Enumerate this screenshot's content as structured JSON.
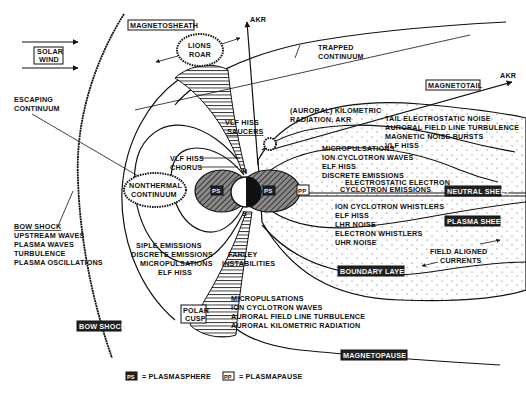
{
  "diagram": {
    "colors": {
      "ink": "#111111",
      "paper": "#ffffff",
      "hatch": "#333333",
      "stipple": "#555555"
    },
    "regions": {
      "solar_wind": [
        "SOLAR",
        "WIND"
      ],
      "magnetosheath": "MAGNETOSHEATH",
      "magnetotail": "MAGNETOTAIL",
      "neutral_sheet": "NEUTRAL SHEET",
      "plasma_sheet": "PLASMA SHEET",
      "boundary_layer": "BOUNDARY LAYER",
      "bow_shock_box": "BOW SHOCK",
      "polar_cusp": [
        "POLAR",
        "CUSP"
      ],
      "magnetopause": "MAGNETOPAUSE"
    },
    "labels": {
      "akr_top": "AKR",
      "akr_tail": "AKR",
      "lions_roar": [
        "LIONS",
        "ROAR"
      ],
      "trapped_continuum": [
        "TRAPPED",
        "CONTINUUM"
      ],
      "escaping_continuum": [
        "ESCAPING",
        "CONTINUUM"
      ],
      "auroral_kilometric": [
        "(AURORAL) KILOMETRIC",
        "RADIATION, AKR"
      ],
      "tail_waves": [
        "TAIL ELECTROSTATIC NOISE",
        "AURORAL FIELD LINE TURBULENCE",
        "MAGNETIC NOISE BURSTS",
        "VLF HISS"
      ],
      "vlf_hiss_saucers": [
        "VLF HISS",
        "SAUCERS"
      ],
      "plasmapause_waves": [
        "MICROPULSATIONS",
        "ION CYCLOTRON WAVES",
        "ELF HISS",
        "DISCRETE EMISSIONS"
      ],
      "electrostatic_electron": [
        "ELECTROSTATIC ELECTRON",
        "CYCLOTRON EMISSIONS"
      ],
      "vlf_hiss_chorus": [
        "VLF HISS",
        "CHORUS"
      ],
      "nonthermal_continuum": [
        "NONTHERMAL",
        "CONTINUUM"
      ],
      "plasma_sheet_waves": [
        "ION CYCLOTRON WHISTLERS",
        "ELF HISS",
        "LHR NOISE",
        "ELECTRON WHISTLERS",
        "UHR NOISE"
      ],
      "field_aligned_currents": [
        "FIELD ALIGNED",
        "CURRENTS"
      ],
      "bow_shock_waves": {
        "heading": "BOW SHOCK",
        "items": [
          "UPSTREAM WAVES",
          "PLASMA WAVES",
          "TURBULENCE",
          "PLASMA OSCILLATIONS"
        ]
      },
      "siple_emissions": [
        "SIPLE EMISSIONS",
        "DISCRETE EMISSIONS",
        "MICROPULSATIONS",
        "ELF HISS"
      ],
      "farley": [
        "FARLEY",
        "INSTABILITIES"
      ],
      "cusp_waves": [
        "MICROPULSATIONS",
        "ION CYCLOTRON WAVES",
        "AURORAL FIELD LINE TURBULENCE",
        "AURORAL KILOMETRIC RADIATION"
      ],
      "north": "N",
      "south": "S",
      "ps_abbr": "PS",
      "pp_abbr": "PP"
    },
    "legend": [
      {
        "symbol": "PS",
        "text": "= PLASMASPHERE"
      },
      {
        "symbol": "PP",
        "text": "= PLASMAPAUSE"
      }
    ]
  }
}
